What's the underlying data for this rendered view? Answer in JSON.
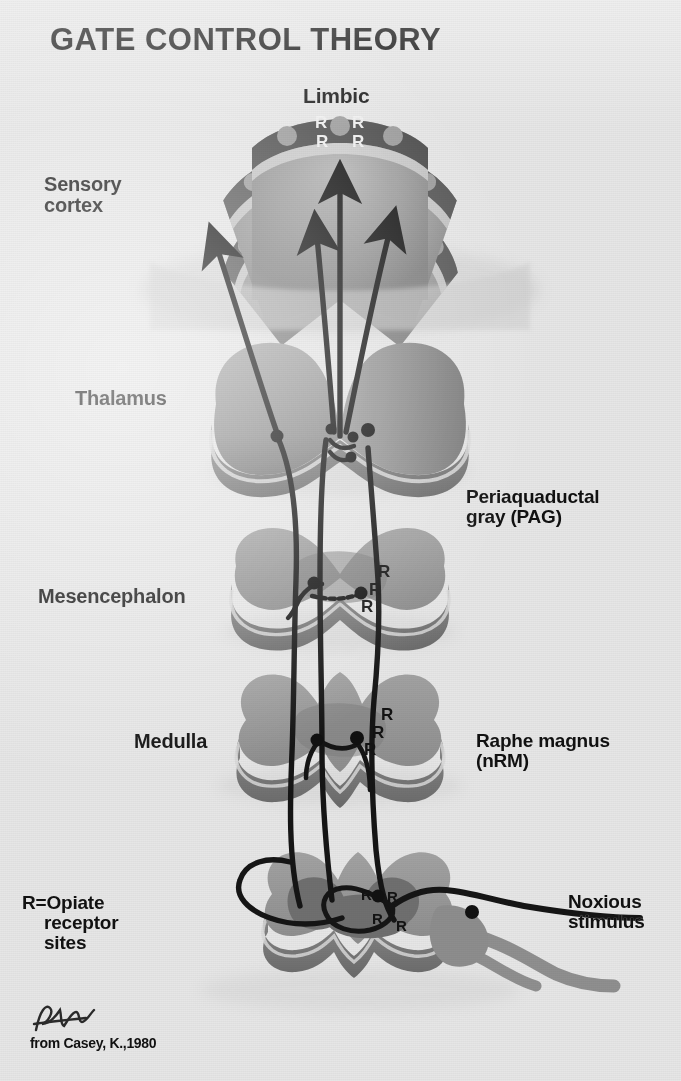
{
  "figure": {
    "title": "GATE CONTROL THEORY",
    "credit": "from Casey, K.,1980",
    "signature": "signature-mark",
    "background_color": "#e6e6e6",
    "ink_color": "#111111"
  },
  "labels": {
    "limbic": "Limbic",
    "sensory_cortex": "Sensory\ncortex",
    "thalamus": "Thalamus",
    "pag": "Periaquaductal\ngray (PAG)",
    "mesencephalon": "Mesencephalon",
    "medulla": "Medulla",
    "raphe_magnus": "Raphe magnus\n(nRM)",
    "noxious_stimulus": "Noxious\nstimulus"
  },
  "legend": {
    "key": "R",
    "equals": "=",
    "term_line1": "Opiate",
    "term_line2": "receptor",
    "term_line3": "sites",
    "full_text": "R=Opiate receptor sites"
  },
  "receptor_markers": {
    "limbic_cortex": {
      "symbol": "R",
      "count": 4,
      "color": "#f0f0f0"
    },
    "mesencephalon_pag": {
      "symbol": "R",
      "count": 3,
      "color": "#131313"
    },
    "medulla_nrm": {
      "symbol": "R",
      "count": 3,
      "color": "#131313"
    },
    "spinal_cord": {
      "symbol": "R",
      "count": 4,
      "color": "#131313"
    }
  },
  "structures": [
    {
      "name": "cerebral-cortex",
      "label": "Sensory cortex / Limbic"
    },
    {
      "name": "thalamus",
      "label": "Thalamus"
    },
    {
      "name": "mesencephalon",
      "label": "Mesencephalon"
    },
    {
      "name": "medulla",
      "label": "Medulla"
    },
    {
      "name": "spinal-cord",
      "label": "Spinal cord"
    }
  ],
  "palette": {
    "brain_light": "#9b9b9b",
    "brain_mid": "#868686",
    "brain_dark": "#6d6d6d",
    "cortex_ribbon": "#5a5a5a",
    "edge_highlight": "#d9d9d9",
    "tract": "#1b1b1b",
    "nerve_gray": "#8d8d8d"
  }
}
